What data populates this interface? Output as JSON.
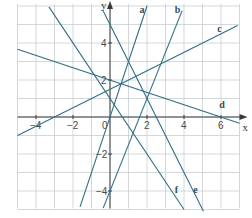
{
  "chart_data": {
    "type": "line",
    "title": "",
    "xlabel": "x",
    "ylabel": "y",
    "xlim": [
      -5,
      7
    ],
    "ylim": [
      -5,
      6
    ],
    "grid": true,
    "x_ticks": [
      {
        "value": -4,
        "label": "−4"
      },
      {
        "value": -2,
        "label": "−2"
      },
      {
        "value": 0,
        "label": "0"
      },
      {
        "value": 2,
        "label": "2"
      },
      {
        "value": 4,
        "label": "4"
      },
      {
        "value": 6,
        "label": "6"
      }
    ],
    "y_ticks": [
      {
        "value": 4,
        "label": "4"
      },
      {
        "value": 2,
        "label": "2"
      },
      {
        "value": -2,
        "label": "−2"
      },
      {
        "value": -4,
        "label": "−4"
      }
    ],
    "series": [
      {
        "name": "a",
        "equation": "y = 3x",
        "slope": 3,
        "intercept": 0,
        "x_range": [
          -1.62,
          2
        ],
        "label_pos": [
          1.6,
          5.6
        ]
      },
      {
        "name": "b",
        "equation": "y = 2.5x - 4",
        "slope": 2.5,
        "intercept": -4,
        "x_range": [
          -0.37,
          3.9
        ],
        "label_pos": [
          3.5,
          5.6
        ]
      },
      {
        "name": "c",
        "equation": "y = 0.5x + 1.5",
        "slope": 0.5,
        "intercept": 1.5,
        "x_range": [
          -5,
          6.9
        ],
        "label_pos": [
          5.8,
          4.6
        ]
      },
      {
        "name": "d",
        "equation": "y = -x/3 + 2",
        "slope": -0.3333,
        "intercept": 2,
        "x_range": [
          -5,
          7
        ],
        "label_pos": [
          5.9,
          0.5
        ]
      },
      {
        "name": "e",
        "equation": "y = -2x + 5",
        "slope": -2,
        "intercept": 5,
        "x_range": [
          -0.4,
          5.05
        ],
        "label_pos": [
          4.5,
          -4.1
        ]
      },
      {
        "name": "f",
        "equation": "y = -1.5x + 1",
        "slope": -1.5,
        "intercept": 1,
        "x_range": [
          -3.3,
          4
        ],
        "label_pos": [
          3.5,
          -4.1
        ]
      }
    ]
  },
  "pixel_map": {
    "origin_x": 110,
    "origin_y": 117,
    "unit": 18.5
  },
  "colors": {
    "line": "#2f6f86",
    "grid": "#c9cdd0",
    "axis": "#3a3a3a"
  }
}
